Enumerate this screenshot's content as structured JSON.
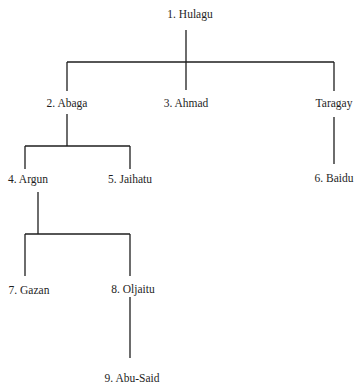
{
  "diagram": {
    "type": "family-tree",
    "line_color": "#1e1e1e",
    "nodes": {
      "hulagu": "1. Hulagu",
      "abaga": "2. Abaga",
      "ahmad": "3. Ahmad",
      "taragay": "Taragay",
      "argun": "4. Argun",
      "jaihatu": "5. Jaihatu",
      "baidu": "6. Baidu",
      "gazan": "7. Gazan",
      "oljaitu": "8. Oljaitu",
      "abu_said": "9. Abu-Said"
    },
    "edges": [
      [
        "hulagu",
        "abaga"
      ],
      [
        "hulagu",
        "ahmad"
      ],
      [
        "hulagu",
        "taragay"
      ],
      [
        "abaga",
        "argun"
      ],
      [
        "abaga",
        "jaihatu"
      ],
      [
        "taragay",
        "baidu"
      ],
      [
        "argun",
        "gazan"
      ],
      [
        "argun",
        "oljaitu"
      ],
      [
        "oljaitu",
        "abu_said"
      ]
    ]
  }
}
